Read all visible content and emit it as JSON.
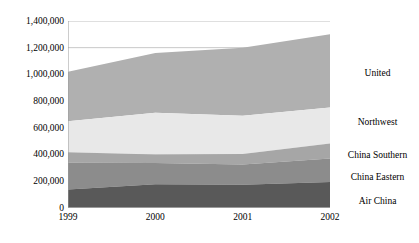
{
  "chart_data": {
    "type": "area",
    "stacked": true,
    "title": "",
    "subtitle": "",
    "xlabel": "",
    "ylabel": "",
    "categories": [
      "1999",
      "2000",
      "2001",
      "2002"
    ],
    "x": [
      1999,
      2000,
      2001,
      2002
    ],
    "xlim": [
      1999,
      2002
    ],
    "ylim": [
      0,
      1400000
    ],
    "ytick_values": [
      0,
      200000,
      400000,
      600000,
      800000,
      1000000,
      1200000,
      1400000
    ],
    "ytick_labels": [
      "0",
      "200,000",
      "400,000",
      "600,000",
      "800,000",
      "1,000,000",
      "1,200,000",
      "1,400,000"
    ],
    "xtick_labels": [
      "1999",
      "2000",
      "2001",
      "2002"
    ],
    "grid": true,
    "grid_axis": "y",
    "legend_position": "right",
    "series": [
      {
        "name": "Air China",
        "color": "#595959",
        "values": [
          138000,
          178000,
          175000,
          195000
        ]
      },
      {
        "name": "China Eastern",
        "color": "#8c8c8c",
        "values": [
          200000,
          158000,
          150000,
          175000
        ]
      },
      {
        "name": "China Southern",
        "color": "#a6a6a6",
        "values": [
          80000,
          65000,
          80000,
          113000
        ]
      },
      {
        "name": "Northwest",
        "color": "#e8e8e8",
        "values": [
          232000,
          312000,
          285000,
          270000
        ]
      },
      {
        "name": "United",
        "color": "#b0b0b0",
        "values": [
          370000,
          447000,
          510000,
          547000
        ]
      }
    ],
    "cumulative_tops": [
      [
        138000,
        338000,
        418000,
        650000,
        1020000
      ],
      [
        178000,
        336000,
        401000,
        713000,
        1160000
      ],
      [
        175000,
        325000,
        405000,
        690000,
        1200000
      ],
      [
        195000,
        370000,
        483000,
        753000,
        1300000
      ]
    ],
    "totals": [
      1020000,
      1160000,
      1200000,
      1300000
    ]
  },
  "legend": {
    "items": [
      {
        "label": "United"
      },
      {
        "label": "Northwest"
      },
      {
        "label": "China Southern"
      },
      {
        "label": "China Eastern"
      },
      {
        "label": "Air China"
      }
    ]
  },
  "axis": {
    "y_labels": [
      "1,400,000",
      "1,200,000",
      "1,000,000",
      "800,000",
      "600,000",
      "400,000",
      "200,000",
      "0"
    ],
    "x_labels": [
      "1999",
      "2000",
      "2001",
      "2002"
    ]
  },
  "colors": {
    "background": "#ffffff",
    "axis": "#808080",
    "gridline": "#bfbfbf",
    "text": "#000000"
  }
}
